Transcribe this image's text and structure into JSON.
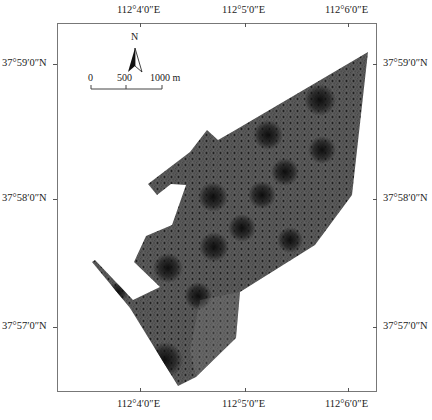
{
  "map": {
    "frame": {
      "left": 57,
      "top": 23,
      "right": 377,
      "bottom": 392
    },
    "top_labels": [
      {
        "text": "112°4′0″E",
        "x": 140
      },
      {
        "text": "112°5′0″E",
        "x": 245
      },
      {
        "text": "112°6′0″E",
        "x": 348
      }
    ],
    "bottom_labels": [
      {
        "text": "112°4′0″E",
        "x": 140
      },
      {
        "text": "112°5′0″E",
        "x": 245
      },
      {
        "text": "112°6′0″E",
        "x": 348
      }
    ],
    "left_labels": [
      {
        "text": "37°59′0″N",
        "y": 64
      },
      {
        "text": "37°58′0″N",
        "y": 199
      },
      {
        "text": "37°57′0″N",
        "y": 327
      }
    ],
    "right_labels": [
      {
        "text": "37°59′0″N",
        "y": 64
      },
      {
        "text": "37°58′0″N",
        "y": 199
      },
      {
        "text": "37°57′0″N",
        "y": 327
      }
    ],
    "north_arrow": {
      "label": "N"
    },
    "scale_bar": {
      "labels": [
        "0",
        "500",
        "1000 m"
      ]
    },
    "mesh_fill_color": "#4a4a4a",
    "mesh_dark_color": "#111111"
  }
}
